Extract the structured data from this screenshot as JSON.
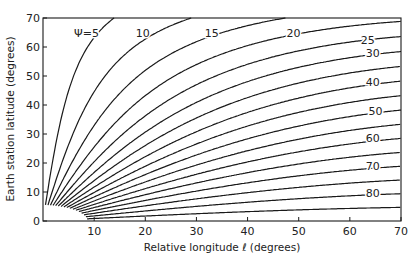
{
  "chart_data": {
    "type": "line",
    "title": "",
    "xlabel": "Relative longitude ℓ (degrees)",
    "ylabel": "Earth station latitude (degrees)",
    "xlim": [
      0,
      70
    ],
    "ylim": [
      0,
      70
    ],
    "x_ticks": [
      10,
      20,
      30,
      40,
      50,
      60,
      70
    ],
    "y_ticks": [
      0,
      10,
      20,
      30,
      40,
      50,
      60,
      70
    ],
    "grid": false,
    "legend": "inline curve labels",
    "relation": "tan(Ψ) = sin(ℓ) / tan(latitude)",
    "curve_parameter": "Ψ",
    "series": [
      {
        "name": "Ψ=5",
        "label": "Ψ=5",
        "psi": 5,
        "end_point": {
          "x": 13.5,
          "y": 70
        }
      },
      {
        "name": "Ψ=10",
        "label": "10",
        "psi": 10,
        "end_point": {
          "x": 28,
          "y": 70
        }
      },
      {
        "name": "Ψ=15",
        "label": "15",
        "psi": 15,
        "end_point": {
          "x": 46,
          "y": 70
        }
      },
      {
        "name": "Ψ=20",
        "label": "20",
        "psi": 20,
        "end_point": {
          "x": 70,
          "y": 68.5
        }
      },
      {
        "name": "Ψ=25",
        "label": "25",
        "psi": 25,
        "end_point": {
          "x": 70,
          "y": 63.4
        }
      },
      {
        "name": "Ψ=30",
        "label": "30",
        "psi": 30,
        "end_point": {
          "x": 70,
          "y": 58.2
        }
      },
      {
        "name": "Ψ=35",
        "label": "",
        "psi": 35,
        "end_point": {
          "x": 70,
          "y": 53.1
        }
      },
      {
        "name": "Ψ=40",
        "label": "40",
        "psi": 40,
        "end_point": {
          "x": 70,
          "y": 48.3
        }
      },
      {
        "name": "Ψ=45",
        "label": "",
        "psi": 45,
        "end_point": {
          "x": 70,
          "y": 43.4
        }
      },
      {
        "name": "Ψ=50",
        "label": "50",
        "psi": 50,
        "end_point": {
          "x": 70,
          "y": 37.6
        }
      },
      {
        "name": "Ψ=55",
        "label": "",
        "psi": 55,
        "end_point": {
          "x": 70,
          "y": 32.0
        }
      },
      {
        "name": "Ψ=60",
        "label": "60",
        "psi": 60,
        "end_point": {
          "x": 70,
          "y": 27.2
        }
      },
      {
        "name": "Ψ=65",
        "label": "",
        "psi": 65,
        "end_point": {
          "x": 70,
          "y": 22.4
        }
      },
      {
        "name": "Ψ=70",
        "label": "70",
        "psi": 70,
        "end_point": {
          "x": 70,
          "y": 17.9
        }
      },
      {
        "name": "Ψ=75",
        "label": "",
        "psi": 75,
        "end_point": {
          "x": 70,
          "y": 13.1
        }
      },
      {
        "name": "Ψ=80",
        "label": "80",
        "psi": 80,
        "end_point": {
          "x": 70,
          "y": 8.6
        }
      },
      {
        "name": "Ψ=85",
        "label": "",
        "psi": 85,
        "end_point": {
          "x": 70,
          "y": 4.1
        }
      }
    ],
    "annotations": [
      {
        "text": "Ψ=5",
        "x": 8.5,
        "y": 65
      },
      {
        "text": "10",
        "x": 19.5,
        "y": 65
      },
      {
        "text": "15",
        "x": 33,
        "y": 65
      },
      {
        "text": "20",
        "x": 49,
        "y": 65
      },
      {
        "text": "25",
        "x": 63.5,
        "y": 62.5
      },
      {
        "text": "30",
        "x": 64.5,
        "y": 58
      },
      {
        "text": "40",
        "x": 64.5,
        "y": 48
      },
      {
        "text": "50",
        "x": 65,
        "y": 38
      },
      {
        "text": "60",
        "x": 64.5,
        "y": 28.5
      },
      {
        "text": "70",
        "x": 64.5,
        "y": 19
      },
      {
        "text": "80",
        "x": 64.5,
        "y": 9.5
      }
    ],
    "excluded_region_boundary": {
      "x_intercept": 8.7,
      "y_intercept": 5.5
    }
  }
}
